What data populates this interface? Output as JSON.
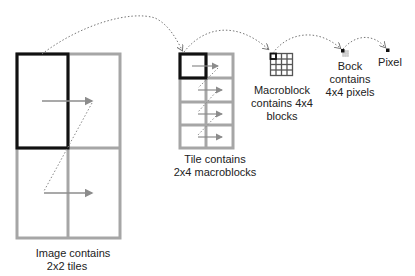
{
  "colors": {
    "grid_gray": "#a6a6a6",
    "highlight_black": "#111111",
    "arrow_gray": "#8c8c8c",
    "dotted_gray": "#777777",
    "text": "#222222"
  },
  "labels": {
    "image": {
      "line1": "Image contains",
      "line2": "2x2 tiles"
    },
    "tile": {
      "line1": "Tile contains",
      "line2": "2x4 macroblocks"
    },
    "macroblock": {
      "line1": "Macroblock",
      "line2": "contains 4x4",
      "line3": "blocks"
    },
    "block": {
      "line1": "Bock",
      "line2": "contains",
      "line3": "4x4 pixels"
    },
    "pixel": {
      "line1": "Pixel"
    }
  },
  "structure": {
    "image_tiles": {
      "cols": 2,
      "rows": 2
    },
    "tile_macroblocks": {
      "cols": 2,
      "rows": 4
    },
    "macroblock_blocks": {
      "cols": 4,
      "rows": 4
    },
    "block_pixels": {
      "cols": 4,
      "rows": 4
    }
  }
}
